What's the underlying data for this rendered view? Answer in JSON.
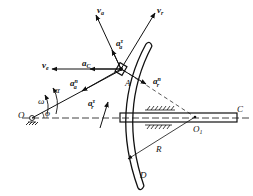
{
  "diagram": {
    "type": "mechanism-kinematics",
    "labels": {
      "O": "O",
      "O1": "O",
      "O1_sub": "1",
      "A": "A",
      "C": "C",
      "D": "D",
      "R": "R",
      "omega": "ω",
      "alpha": "α",
      "phi": "φ"
    },
    "vectors": {
      "va": {
        "base": "v",
        "sub": "a"
      },
      "vr": {
        "base": "v",
        "sub": "r"
      },
      "ve": {
        "base": "v",
        "sub": "e"
      },
      "ac": {
        "base": "a",
        "sub": "C"
      },
      "aa_tau": {
        "base": "a",
        "sub": "a",
        "sup": "τ"
      },
      "aa_n": {
        "base": "a",
        "sub": "a",
        "sup": "n"
      },
      "ar_tau": {
        "base": "a",
        "sub": "r",
        "sup": "τ"
      },
      "ar_n": {
        "base": "a",
        "sub": "r",
        "sup": "n"
      }
    },
    "colors": {
      "stroke": "#111111",
      "background": "#ffffff"
    }
  }
}
